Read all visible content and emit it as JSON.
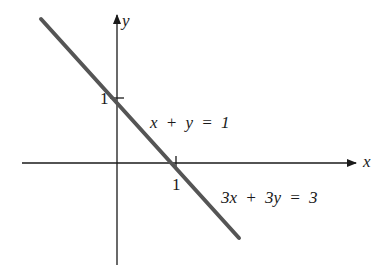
{
  "figure": {
    "type": "cartesian-line-diagram",
    "axes": {
      "x_label": "x",
      "y_label": "y",
      "x_tick_label": "1",
      "y_tick_label": "1"
    },
    "line": {
      "color": "#555555",
      "equations": [
        "x + y = 1",
        "3x + 3y = 3"
      ],
      "x_intercept": 1,
      "y_intercept": 1
    },
    "labels": {
      "eq1": "x + y = 1",
      "eq2": "3x + 3y = 3"
    }
  }
}
